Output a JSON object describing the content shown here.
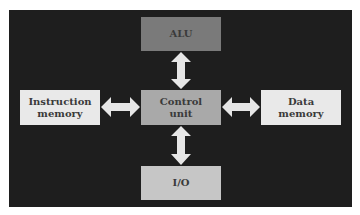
{
  "diagram": {
    "type": "block-diagram",
    "colors": {
      "background": "#1e1e1e",
      "arrow": "#e6e6e6",
      "alu": "#7a7a7a",
      "control": "#a9a9a9",
      "io": "#c6c6c6",
      "memory": "#e9e9e9",
      "text": "#3a3a3a"
    },
    "nodes": {
      "alu": {
        "label": "ALU"
      },
      "control": {
        "label": "Control\nunit"
      },
      "io": {
        "label": "I/O"
      },
      "instruction_memory": {
        "label": "Instruction\nmemory"
      },
      "data_memory": {
        "label": "Data\nmemory"
      }
    },
    "edges": [
      {
        "from": "control",
        "to": "alu",
        "type": "bidirectional"
      },
      {
        "from": "control",
        "to": "io",
        "type": "bidirectional"
      },
      {
        "from": "control",
        "to": "instruction_memory",
        "type": "bidirectional"
      },
      {
        "from": "control",
        "to": "data_memory",
        "type": "bidirectional"
      }
    ]
  }
}
